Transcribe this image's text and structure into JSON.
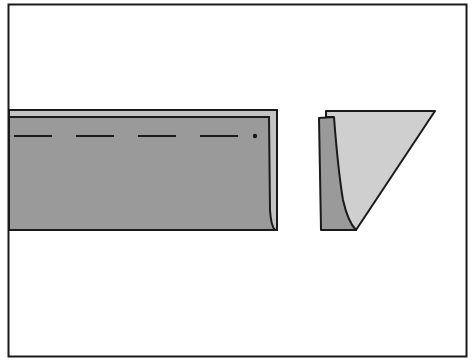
{
  "figure": {
    "colors": {
      "background": "#ffffff",
      "outline": "#1a1a1a",
      "fabric_dark": "#9a9a9a",
      "fabric_light": "#cfcfcf",
      "fabric_back": "#c4c4c4"
    },
    "parts": [
      {
        "id": "folded-strip",
        "label": "Folded strip with stitching line"
      },
      {
        "id": "strip-end-view",
        "label": "End view of folded strip"
      }
    ]
  }
}
